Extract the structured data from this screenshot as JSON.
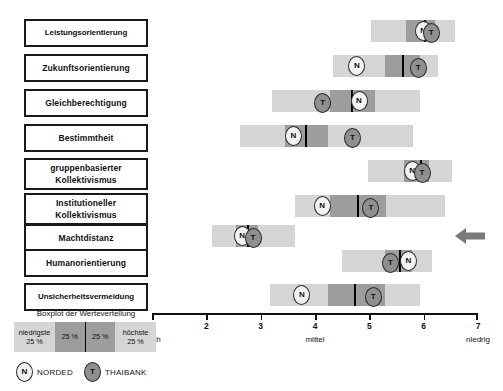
{
  "chart_data": {
    "type": "boxplot",
    "title": "Boxplot der Werteverteilung",
    "xlabel": "",
    "ylabel": "",
    "xlim": [
      1,
      7
    ],
    "xticks": [
      "1",
      "2",
      "3",
      "4",
      "5",
      "6",
      "7"
    ],
    "axis_anchors": [
      {
        "label": "hoch",
        "value": 1
      },
      {
        "label": "mittel",
        "value": 4
      },
      {
        "label": "niedrig",
        "value": 7
      }
    ],
    "grid": false,
    "legend_position": "bottom-left",
    "series_markers": [
      {
        "key": "N",
        "name": "NORDED"
      },
      {
        "key": "T",
        "name": "THAIBANK"
      }
    ],
    "quartile_legend": {
      "title": "Boxplot der Werteverteilung",
      "segments": [
        {
          "label": "niedrigste",
          "value": "25 %",
          "shade": "light"
        },
        {
          "label": "",
          "value": "25 %",
          "shade": "dark"
        },
        {
          "label": "",
          "value": "25 %",
          "shade": "dark"
        },
        {
          "label": "höchste",
          "value": "25 %",
          "shade": "light"
        }
      ]
    },
    "categories": [
      "Leistungsorientierung",
      "Zukunftsorientierung",
      "Gleichberechtigung",
      "Bestimmtheit",
      "gruppenbasierter Kollektivismus",
      "Institutioneller Kollektivismus",
      "Machtdistanz",
      "Humanorientierung",
      "Unsicherheitsvermeidung"
    ],
    "rows": [
      {
        "label_lines": [
          "Leistungsorientierung"
        ],
        "min": 5.03,
        "q1": 5.68,
        "median": 6.03,
        "q3": 6.2,
        "max": 6.58,
        "norded": 5.99,
        "thaibank": 6.14,
        "highlighted": false
      },
      {
        "label_lines": [
          "Zukunftsorientierung"
        ],
        "min": 4.33,
        "q1": 5.29,
        "median": 5.62,
        "q3": 5.93,
        "max": 6.26,
        "norded": 4.77,
        "thaibank": 5.9,
        "highlighted": false
      },
      {
        "label_lines": [
          "Gleichberechtigung"
        ],
        "min": 3.21,
        "q1": 4.28,
        "median": 4.68,
        "q3": 5.1,
        "max": 5.94,
        "norded": 4.81,
        "thaibank": 4.14,
        "highlighted": false
      },
      {
        "label_lines": [
          "Bestimmtheit"
        ],
        "min": 2.62,
        "q1": 3.45,
        "median": 3.83,
        "q3": 4.24,
        "max": 5.81,
        "norded": 3.6,
        "thaibank": 4.69,
        "highlighted": false
      },
      {
        "label_lines": [
          "gruppenbasierter",
          "Kollektivismus"
        ],
        "min": 4.98,
        "q1": 5.64,
        "median": 5.95,
        "q3": 6.09,
        "max": 6.53,
        "norded": 5.79,
        "thaibank": 5.97,
        "highlighted": false
      },
      {
        "label_lines": [
          "Institutioneller",
          "Kollektivismus"
        ],
        "min": 3.63,
        "q1": 4.28,
        "median": 4.79,
        "q3": 5.3,
        "max": 6.4,
        "norded": 4.13,
        "thaibank": 5.03,
        "highlighted": false
      },
      {
        "label_lines": [
          "Machtdistanz"
        ],
        "min": 2.1,
        "q1": 2.55,
        "median": 2.77,
        "q3": 2.95,
        "max": 3.63,
        "norded": 2.66,
        "thaibank": 2.86,
        "highlighted": true
      },
      {
        "label_lines": [
          "Humanorientierung"
        ],
        "min": 4.5,
        "q1": 5.29,
        "median": 5.57,
        "q3": 5.79,
        "max": 6.15,
        "norded": 5.72,
        "thaibank": 5.39,
        "highlighted": false
      },
      {
        "label_lines": [
          "Unsicherheitsvermeidung"
        ],
        "min": 3.17,
        "q1": 4.24,
        "median": 4.74,
        "q3": 5.29,
        "max": 5.94,
        "norded": 3.76,
        "thaibank": 5.07,
        "highlighted": false
      }
    ],
    "colors": {
      "whisker_box": "#d5d5d5",
      "iqr_box": "#9d9d9d",
      "median_line": "#000000",
      "norded_marker": "#f2f2f2",
      "thaibank_marker": "#8f8f8f",
      "arrow": "#7a7a7a",
      "text": "#111111",
      "background": "#ffffff"
    },
    "annotations": [
      {
        "name": "row-highlight-arrow",
        "points_to": "Machtdistanz",
        "direction": "left"
      }
    ]
  }
}
